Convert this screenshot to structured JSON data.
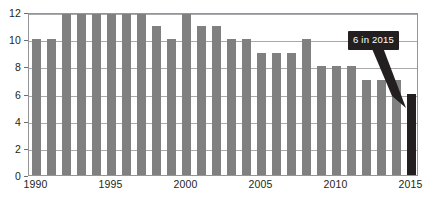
{
  "chart_data": {
    "type": "bar",
    "title": "",
    "xlabel": "",
    "ylabel": "",
    "ylim": [
      0,
      12
    ],
    "grid": true,
    "legend": null,
    "categories": [
      "1990",
      "1991",
      "1992",
      "1993",
      "1994",
      "1995",
      "1996",
      "1997",
      "1998",
      "1999",
      "2000",
      "2001",
      "2002",
      "2003",
      "2004",
      "2005",
      "2006",
      "2007",
      "2008",
      "2009",
      "2010",
      "2011",
      "2012",
      "2013",
      "2014",
      "2015"
    ],
    "values": [
      10,
      10,
      12,
      12,
      12,
      12,
      12,
      12,
      11,
      10,
      12,
      11,
      11,
      10,
      10,
      9,
      9,
      9,
      10,
      8,
      8,
      8,
      7,
      7,
      7,
      6
    ],
    "x_tick_labels": [
      "1990",
      "1995",
      "2000",
      "2005",
      "2010",
      "2015"
    ],
    "x_tick_categories": [
      "1990",
      "1995",
      "2000",
      "2005",
      "2010",
      "2015"
    ],
    "y_tick_labels": [
      "0",
      "2",
      "4",
      "6",
      "8",
      "10",
      "12"
    ],
    "y_tick_values": [
      0,
      2,
      4,
      6,
      8,
      10,
      12
    ],
    "highlight_category": "2015",
    "highlight_value": 6,
    "annotations": [
      {
        "name": "callout",
        "text": "6 in 2015",
        "target_category": "2015",
        "target_value": 6
      }
    ],
    "colors": {
      "bar": "#808080",
      "bar_highlight": "#231f20",
      "gridline": "#a7a9ac",
      "frame": "#939598",
      "callout_background": "#231f20",
      "callout_text": "#ffffff",
      "axis_text": "#231f20",
      "background": "#ffffff"
    }
  }
}
